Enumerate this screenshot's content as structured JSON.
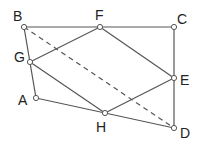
{
  "diagram": {
    "type": "geometry",
    "points": {
      "B": {
        "x": 24,
        "y": 27,
        "label": "B",
        "lx": 13,
        "ly": 21
      },
      "F": {
        "x": 100,
        "y": 27,
        "label": "F",
        "lx": 95,
        "ly": 20
      },
      "C": {
        "x": 174,
        "y": 27,
        "label": "C",
        "lx": 177,
        "ly": 24
      },
      "G": {
        "x": 30,
        "y": 62,
        "label": "G",
        "lx": 14,
        "ly": 62
      },
      "E": {
        "x": 174,
        "y": 78,
        "label": "E",
        "lx": 180,
        "ly": 85
      },
      "A": {
        "x": 36,
        "y": 98,
        "label": "A",
        "lx": 18,
        "ly": 105
      },
      "H": {
        "x": 105,
        "y": 113,
        "label": "H",
        "lx": 96,
        "ly": 132
      },
      "D": {
        "x": 174,
        "y": 128,
        "label": "D",
        "lx": 180,
        "ly": 138
      }
    },
    "solid_segments": [
      [
        "B",
        "C"
      ],
      [
        "C",
        "D"
      ],
      [
        "D",
        "A"
      ],
      [
        "A",
        "B"
      ],
      [
        "G",
        "F"
      ],
      [
        "F",
        "E"
      ],
      [
        "E",
        "H"
      ],
      [
        "H",
        "G"
      ]
    ],
    "dashed_segments": [
      [
        "B",
        "D"
      ]
    ],
    "colors": {
      "line": "#555555",
      "point_fill": "#ffffff",
      "point_stroke": "#555555"
    }
  }
}
